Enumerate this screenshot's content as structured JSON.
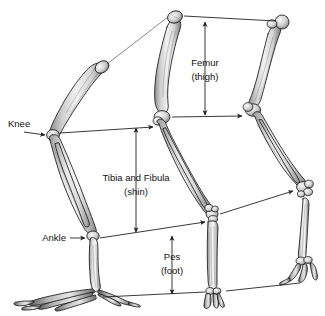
{
  "figure": {
    "background_color": "#ffffff",
    "line_color": "#222222",
    "text_color": "#111111",
    "width": 325,
    "height": 316
  },
  "labels": {
    "knee": "Knee",
    "ankle": "Ankle",
    "femur_main": "Femur",
    "femur_sub": "(thigh)",
    "tibia_main": "Tibia and Fibula",
    "tibia_sub": "(shin)",
    "pes_main": "Pes",
    "pes_sub": "(foot)"
  },
  "specimens": [
    {
      "name": "left-limb-bird",
      "posture": "digitigrade-clawed",
      "description": "Left limb with elongated shin, raised heel and spread clawed toes"
    },
    {
      "name": "middle-limb-ungulate",
      "posture": "digitigrade-elongate-metatarsus",
      "description": "Middle limb with long femur, long fused metatarsus and short digits"
    },
    {
      "name": "right-limb-plantigrade",
      "posture": "plantigrade",
      "description": "Right limb with rounded femoral head, compact ankle and flat foot"
    }
  ],
  "annotations": [
    {
      "name": "knee-pointer",
      "label": "Knee",
      "kind": "single-arrow",
      "points_to": "left-limb-knee-joint"
    },
    {
      "name": "ankle-pointer",
      "label": "Ankle",
      "kind": "single-arrow",
      "points_to": "left-limb-ankle-joint"
    },
    {
      "name": "knee-correspondence-1",
      "kind": "single-arrow",
      "from": "left-limb-knee-joint",
      "to": "middle-limb-knee-joint"
    },
    {
      "name": "knee-correspondence-2",
      "kind": "single-arrow",
      "from": "middle-limb-knee-joint",
      "to": "right-limb-knee-joint"
    },
    {
      "name": "ankle-correspondence-1",
      "kind": "single-arrow",
      "from": "left-limb-ankle-joint",
      "to": "middle-limb-ankle-joint"
    },
    {
      "name": "ankle-correspondence-2",
      "kind": "single-arrow",
      "from": "middle-limb-ankle-joint",
      "to": "right-limb-ankle-joint"
    },
    {
      "name": "hip-correspondence",
      "kind": "plain-line",
      "from": "middle-limb-hip",
      "to": "right-limb-hip"
    },
    {
      "name": "left-to-middle-hip-line",
      "kind": "plain-line",
      "from": "left-limb-hip",
      "to": "middle-limb-hip"
    },
    {
      "name": "ground-line",
      "kind": "plain-line",
      "from": "left-limb-toes",
      "to": "right-limb-toes"
    },
    {
      "name": "femur-span",
      "label": "Femur (thigh)",
      "kind": "double-arrow",
      "orientation": "vertical"
    },
    {
      "name": "tibia-span",
      "label": "Tibia and Fibula (shin)",
      "kind": "double-arrow",
      "orientation": "vertical"
    },
    {
      "name": "pes-span",
      "label": "Pes (foot)",
      "kind": "double-arrow",
      "orientation": "vertical"
    }
  ]
}
